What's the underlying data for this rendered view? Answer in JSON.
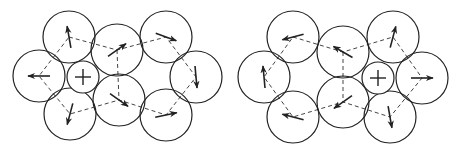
{
  "diagram": {
    "colors": {
      "stroke": "#222222",
      "dash": "#444444",
      "background": "#ffffff"
    },
    "panels": [
      {
        "id": "left",
        "plus": {
          "cx": 83,
          "cy": 77,
          "r": 16,
          "label": "+"
        },
        "circles": [
          {
            "id": "tl",
            "cx": 69,
            "cy": 37,
            "r": 26,
            "arrow_deg": -100
          },
          {
            "id": "l",
            "cx": 39,
            "cy": 76,
            "r": 26,
            "arrow_deg": 180
          },
          {
            "id": "bl",
            "cx": 70,
            "cy": 114,
            "r": 26,
            "arrow_deg": 105
          },
          {
            "id": "tc",
            "cx": 117,
            "cy": 50,
            "r": 26,
            "arrow_deg": -35
          },
          {
            "id": "bc",
            "cx": 119,
            "cy": 100,
            "r": 26,
            "arrow_deg": 35
          },
          {
            "id": "tr",
            "cx": 166,
            "cy": 37,
            "r": 26,
            "arrow_deg": 20
          },
          {
            "id": "r",
            "cx": 196,
            "cy": 77,
            "r": 26,
            "arrow_deg": 85
          },
          {
            "id": "br",
            "cx": 166,
            "cy": 115,
            "r": 26,
            "arrow_deg": -12
          }
        ],
        "path": [
          [
            69,
            37
          ],
          [
            117,
            50
          ],
          [
            166,
            37
          ],
          [
            196,
            77
          ],
          [
            166,
            115
          ],
          [
            119,
            100
          ],
          [
            70,
            114
          ],
          [
            39,
            76
          ],
          [
            69,
            37
          ]
        ],
        "extra_path": [
          [
            117,
            50
          ],
          [
            119,
            100
          ]
        ]
      },
      {
        "id": "right",
        "plus": {
          "cx": 378,
          "cy": 78,
          "r": 16,
          "label": "+"
        },
        "circles": [
          {
            "id": "tl",
            "cx": 293,
            "cy": 37,
            "r": 26,
            "arrow_deg": 165
          },
          {
            "id": "l",
            "cx": 264,
            "cy": 77,
            "r": 26,
            "arrow_deg": -95
          },
          {
            "id": "bl",
            "cx": 293,
            "cy": 117,
            "r": 26,
            "arrow_deg": -165
          },
          {
            "id": "tc",
            "cx": 343,
            "cy": 52,
            "r": 26,
            "arrow_deg": -150
          },
          {
            "id": "bc",
            "cx": 343,
            "cy": 102,
            "r": 26,
            "arrow_deg": 145
          },
          {
            "id": "tr",
            "cx": 393,
            "cy": 37,
            "r": 26,
            "arrow_deg": -75
          },
          {
            "id": "r",
            "cx": 422,
            "cy": 78,
            "r": 26,
            "arrow_deg": 0
          },
          {
            "id": "br",
            "cx": 390,
            "cy": 117,
            "r": 26,
            "arrow_deg": 80
          }
        ],
        "path": [
          [
            293,
            37
          ],
          [
            343,
            52
          ],
          [
            393,
            37
          ],
          [
            422,
            78
          ],
          [
            390,
            117
          ],
          [
            343,
            102
          ],
          [
            293,
            117
          ],
          [
            264,
            77
          ],
          [
            293,
            37
          ]
        ],
        "extra_path": [
          [
            343,
            52
          ],
          [
            343,
            102
          ]
        ]
      }
    ]
  }
}
